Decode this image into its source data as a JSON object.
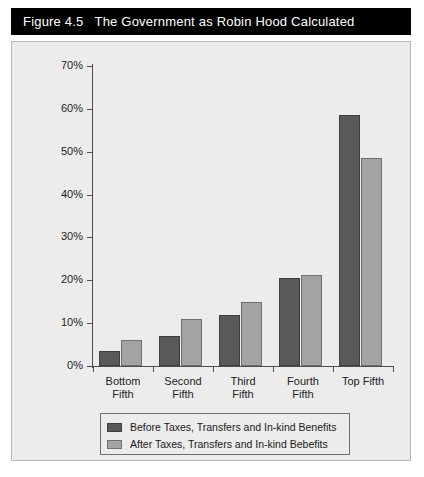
{
  "figure": {
    "number": "Figure 4.5",
    "title": "The Government as Robin Hood Calculated"
  },
  "colors": {
    "title_bar_bg": "#000000",
    "title_bar_text": "#ffffff",
    "panel_bg": "#ececec",
    "series_before": "#595959",
    "series_after": "#a3a3a3",
    "axis": "#4d4d4d"
  },
  "chart_data": {
    "type": "bar",
    "title": "The Government as Robin Hood Calculated",
    "xlabel": "",
    "ylabel": "",
    "ylim": [
      0,
      70
    ],
    "ytick_values": [
      0,
      10,
      20,
      30,
      40,
      50,
      60,
      70
    ],
    "ytick_labels": [
      "0%",
      "10%",
      "20%",
      "30%",
      "40%",
      "50%",
      "60%",
      "70%"
    ],
    "grid": false,
    "legend_position": "bottom",
    "categories": [
      "Bottom Fifth",
      "Second Fifth",
      "Third Fifth",
      "Fourth Fifth",
      "Top Fifth"
    ],
    "category_lines": [
      [
        "Bottom",
        "Fifth"
      ],
      [
        "Second",
        "Fifth"
      ],
      [
        "Third",
        "Fifth"
      ],
      [
        "Fourth",
        "Fifth"
      ],
      [
        "Top Fifth",
        ""
      ]
    ],
    "series": [
      {
        "name": "Before Taxes, Transfers and In-kind Benefits",
        "color": "#595959",
        "values": [
          3.5,
          7.0,
          12.0,
          20.5,
          58.5
        ]
      },
      {
        "name": "After Taxes, Transfers and In-kind Bebefits",
        "color": "#a3a3a3",
        "values": [
          6.0,
          11.0,
          15.0,
          21.2,
          48.5
        ]
      }
    ]
  },
  "legend": {
    "items": [
      {
        "label": "Before Taxes, Transfers and In-kind Benefits",
        "swatch": "before"
      },
      {
        "label": "After Taxes, Transfers and In-kind Bebefits",
        "swatch": "after"
      }
    ]
  }
}
